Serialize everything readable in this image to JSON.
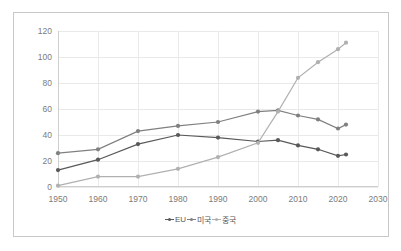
{
  "chart_data": {
    "type": "line",
    "title": "",
    "xlabel": "",
    "ylabel": "",
    "x": [
      1950,
      1960,
      1970,
      1980,
      1990,
      2000,
      2005,
      2010,
      2015,
      2020,
      2022
    ],
    "xlim": [
      1950,
      2030
    ],
    "ylim": [
      0,
      120
    ],
    "xticks": [
      "1950",
      "1960",
      "1970",
      "1980",
      "1990",
      "2000",
      "2010",
      "2020",
      "2030"
    ],
    "xtick_values": [
      1950,
      1960,
      1970,
      1980,
      1990,
      2000,
      2010,
      2020,
      2030
    ],
    "yticks": [
      "0",
      "20",
      "40",
      "60",
      "80",
      "100",
      "120"
    ],
    "ytick_values": [
      0,
      20,
      40,
      60,
      80,
      100,
      120
    ],
    "grid": true,
    "legend_position": "bottom",
    "series": [
      {
        "name": "EU",
        "color": "#595959",
        "values": [
          13,
          21,
          33,
          40,
          38,
          35,
          36,
          32,
          29,
          24,
          25
        ]
      },
      {
        "name": "미국",
        "color": "#808080",
        "values": [
          26,
          29,
          43,
          47,
          50,
          58,
          59,
          55,
          52,
          45,
          48
        ]
      },
      {
        "name": "중국",
        "color": "#b0b0b0",
        "values": [
          1,
          8,
          8,
          14,
          23,
          34,
          58,
          84,
          96,
          106,
          111
        ]
      }
    ]
  },
  "legend": {
    "items": [
      {
        "label": "EU",
        "marker": "diamond-marker",
        "color": "#595959"
      },
      {
        "label": "미국",
        "marker": "diamond-marker",
        "color": "#808080"
      },
      {
        "label": "중국",
        "marker": "diamond-marker",
        "color": "#b0b0b0"
      }
    ]
  }
}
